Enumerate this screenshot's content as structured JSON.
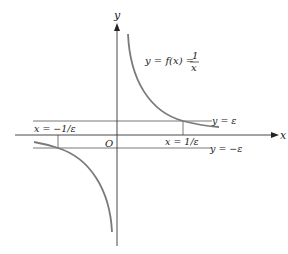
{
  "diagram": {
    "function_label": "y = f(x) = ",
    "fraction_num": "1",
    "fraction_den": "x",
    "axis_x_label": "x",
    "axis_y_label": "y",
    "origin_label": "O",
    "upper_band_label": "y = ε",
    "lower_band_label": "y = −ε",
    "pos_x_label": "x = 1/ε",
    "neg_x_label": "x = −1/ε",
    "colors": {
      "curve": "#7a7a7a",
      "axis": "#333333",
      "band": "#555555"
    }
  }
}
